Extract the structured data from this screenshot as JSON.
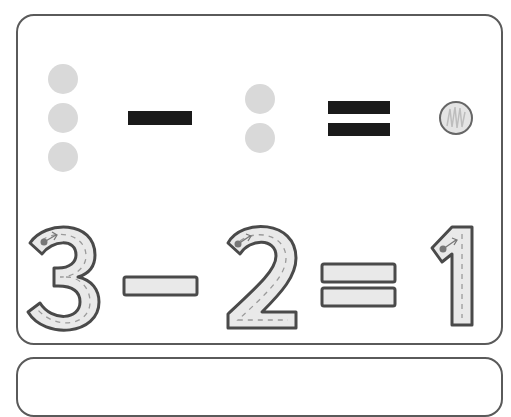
{
  "worksheet": {
    "card1": {
      "pictorial_equation": {
        "left_dots_count": 3,
        "operator": "minus",
        "right_dots_count": 2,
        "equals": "equals",
        "answer_placeholder": "scribbled-circle"
      },
      "traced_equation": {
        "operand1": "3",
        "operator": "−",
        "operand2": "2",
        "equals": "=",
        "result": "1"
      }
    },
    "colors": {
      "dot_fill": "#d9d9d9",
      "symbol_black": "#1a1a1a",
      "outline": "#4a4a4a",
      "trace_fill": "#e9e9e9",
      "card_border": "#5a5a5a"
    }
  }
}
